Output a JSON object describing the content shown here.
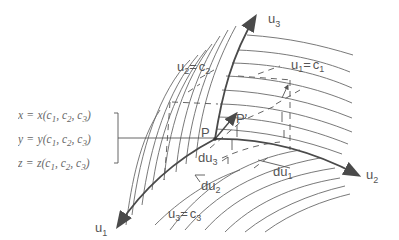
{
  "diagram": {
    "type": "curvilinear-coordinates",
    "axes": [
      {
        "id": "u1",
        "label": "u",
        "sub": "1"
      },
      {
        "id": "u2",
        "label": "u",
        "sub": "2"
      },
      {
        "id": "u3",
        "label": "u",
        "sub": "3"
      }
    ],
    "surface_labels": {
      "u1_eq": {
        "lhs": "u",
        "lhs_sub": "1",
        "eq": "=",
        "rhs": "c",
        "rhs_sub": "1"
      },
      "u2_eq": {
        "lhs": "u",
        "lhs_sub": "2",
        "eq": "=",
        "rhs": "c",
        "rhs_sub": "2"
      },
      "u3_eq": {
        "lhs": "u",
        "lhs_sub": "3",
        "eq": "=",
        "rhs": "c",
        "rhs_sub": "3"
      }
    },
    "points": {
      "P": "P",
      "P_prime": "P'"
    },
    "differentials": [
      {
        "id": "du1",
        "label": "du",
        "sub": "1"
      },
      {
        "id": "du2",
        "label": "du",
        "sub": "2"
      },
      {
        "id": "du3",
        "label": "du",
        "sub": "3"
      }
    ],
    "equations": [
      {
        "lhs": "x",
        "fn": "x",
        "args": "(c",
        "s1": "1",
        "a2": ", c",
        "s2": "2",
        "a3": ", c",
        "s3": "3",
        "close": ")"
      },
      {
        "lhs": "y",
        "fn": "y",
        "args": "(c",
        "s1": "1",
        "a2": ", c",
        "s2": "2",
        "a3": ", c",
        "s3": "3",
        "close": ")"
      },
      {
        "lhs": "z",
        "fn": "z",
        "args": "(c",
        "s1": "1",
        "a2": ", c",
        "s2": "2",
        "a3": ", c",
        "s3": "3",
        "close": ")"
      }
    ],
    "equals": "="
  }
}
